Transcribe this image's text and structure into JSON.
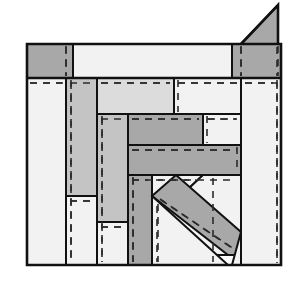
{
  "figure": {
    "kind": "technical-line-diagram",
    "canvas": {
      "width": 300,
      "height": 287,
      "background": "#ffffff"
    },
    "palette": {
      "fill_dark_gray": "#a8a8a8",
      "fill_mid_gray": "#c4c4c4",
      "fill_light_gray": "#dcdcdc",
      "fill_white": "#f2f2f2",
      "stroke": "#111111",
      "dash_stroke": "#2b2b2b"
    },
    "frame": {
      "x": 27,
      "y": 44,
      "width": 254,
      "height": 221
    },
    "blocks": [
      {
        "name": "top-left-header-block",
        "shape": "rect",
        "x": 27,
        "y": 44,
        "w": 46,
        "h": 34,
        "fill": "#a8a8a8",
        "dashes": [
          {
            "x1": 66,
            "y1": 46,
            "x2": 66,
            "y2": 76
          }
        ]
      },
      {
        "name": "top-stretcher-block",
        "shape": "rect",
        "x": 73,
        "y": 44,
        "w": 159,
        "h": 34,
        "fill": "#f2f2f2",
        "dashes": []
      },
      {
        "name": "top-right-header-block",
        "shape": "rect",
        "x": 232,
        "y": 44,
        "w": 49,
        "h": 34,
        "fill": "#a8a8a8",
        "dashes": [
          {
            "x1": 241,
            "y1": 46,
            "x2": 241,
            "y2": 76
          },
          {
            "x1": 278,
            "y1": 46,
            "x2": 278,
            "y2": 76
          }
        ]
      },
      {
        "name": "corner-triangle-block",
        "shape": "triangle",
        "points": "241,44 278,44 278,5",
        "fill": "#a8a8a8",
        "dashes": []
      },
      {
        "name": "left-tall-white-column",
        "shape": "rect",
        "x": 27,
        "y": 78,
        "w": 39,
        "h": 187,
        "fill": "#f2f2f2",
        "dashes": [
          {
            "x1": 30,
            "y1": 83,
            "x2": 62,
            "y2": 83
          }
        ]
      },
      {
        "name": "second-gray-column-upper",
        "shape": "rect",
        "x": 66,
        "y": 78,
        "w": 31,
        "h": 118,
        "fill": "#c4c4c4",
        "dashes": [
          {
            "x1": 70,
            "y1": 83,
            "x2": 93,
            "y2": 83
          },
          {
            "x1": 71,
            "y1": 80,
            "x2": 71,
            "y2": 194
          }
        ]
      },
      {
        "name": "second-white-column-lower",
        "shape": "rect",
        "x": 66,
        "y": 196,
        "w": 31,
        "h": 69,
        "fill": "#f2f2f2",
        "dashes": [
          {
            "x1": 70,
            "y1": 201,
            "x2": 93,
            "y2": 201
          },
          {
            "x1": 71,
            "y1": 198,
            "x2": 71,
            "y2": 263
          }
        ]
      },
      {
        "name": "upper-mid-light-block",
        "shape": "rect",
        "x": 97,
        "y": 78,
        "w": 77,
        "h": 36,
        "fill": "#dcdcdc",
        "dashes": [
          {
            "x1": 101,
            "y1": 83,
            "x2": 170,
            "y2": 83
          }
        ]
      },
      {
        "name": "upper-right-white-block",
        "shape": "rect",
        "x": 174,
        "y": 78,
        "w": 67,
        "h": 36,
        "fill": "#f2f2f2",
        "dashes": [
          {
            "x1": 178,
            "y1": 83,
            "x2": 237,
            "y2": 83
          },
          {
            "x1": 178,
            "y1": 80,
            "x2": 178,
            "y2": 112
          }
        ]
      },
      {
        "name": "right-tall-white-column",
        "shape": "rect",
        "x": 241,
        "y": 78,
        "w": 40,
        "h": 187,
        "fill": "#f2f2f2",
        "dashes": [
          {
            "x1": 245,
            "y1": 83,
            "x2": 277,
            "y2": 83
          },
          {
            "x1": 277,
            "y1": 80,
            "x2": 277,
            "y2": 263
          }
        ]
      },
      {
        "name": "third-gray-column",
        "shape": "rect",
        "x": 97,
        "y": 114,
        "w": 31,
        "h": 108,
        "fill": "#c4c4c4",
        "dashes": [
          {
            "x1": 101,
            "y1": 119,
            "x2": 124,
            "y2": 119
          },
          {
            "x1": 102,
            "y1": 116,
            "x2": 102,
            "y2": 220
          }
        ]
      },
      {
        "name": "third-white-column-lower",
        "shape": "rect",
        "x": 97,
        "y": 222,
        "w": 31,
        "h": 43,
        "fill": "#f2f2f2",
        "dashes": [
          {
            "x1": 101,
            "y1": 227,
            "x2": 124,
            "y2": 227
          },
          {
            "x1": 102,
            "y1": 224,
            "x2": 102,
            "y2": 263
          }
        ]
      },
      {
        "name": "mid-dark-stretcher-block",
        "shape": "rect",
        "x": 128,
        "y": 114,
        "w": 75,
        "h": 31,
        "fill": "#a8a8a8",
        "dashes": [
          {
            "x1": 132,
            "y1": 119,
            "x2": 199,
            "y2": 119
          }
        ]
      },
      {
        "name": "mid-right-white-block",
        "shape": "rect",
        "x": 203,
        "y": 114,
        "w": 38,
        "h": 31,
        "fill": "#f2f2f2",
        "dashes": [
          {
            "x1": 207,
            "y1": 119,
            "x2": 237,
            "y2": 119
          },
          {
            "x1": 207,
            "y1": 116,
            "x2": 207,
            "y2": 143
          }
        ]
      },
      {
        "name": "long-dark-stretcher-block",
        "shape": "rect",
        "x": 128,
        "y": 145,
        "w": 113,
        "h": 30,
        "fill": "#a8a8a8",
        "dashes": [
          {
            "x1": 132,
            "y1": 150,
            "x2": 237,
            "y2": 150
          },
          {
            "x1": 237,
            "y1": 147,
            "x2": 237,
            "y2": 173
          }
        ]
      },
      {
        "name": "lower-gray-column",
        "shape": "rect",
        "x": 128,
        "y": 175,
        "w": 24,
        "h": 90,
        "fill": "#a8a8a8",
        "dashes": [
          {
            "x1": 132,
            "y1": 180,
            "x2": 148,
            "y2": 180
          },
          {
            "x1": 133,
            "y1": 177,
            "x2": 133,
            "y2": 263
          }
        ]
      },
      {
        "name": "lower-left-white-wedge",
        "shape": "polygon",
        "points": "152,175 203,175 152,223",
        "fill": "#f2f2f2",
        "dashes": [
          {
            "x1": 156,
            "y1": 180,
            "x2": 196,
            "y2": 180
          }
        ]
      },
      {
        "name": "diagonal-gray-brace",
        "shape": "polygon",
        "points": "203,175 241,175 241,255 152,255 152,223",
        "fill": "#f2f2f2",
        "dashes": []
      },
      {
        "name": "diagonal-stripe-block",
        "shape": "polygon",
        "points": "152,196 176,175 241,232 241,255 228,255",
        "fill": "#a8a8a8",
        "dashes": [
          {
            "x1": 160,
            "y1": 199,
            "x2": 235,
            "y2": 250
          }
        ]
      },
      {
        "name": "bottom-white-triangle",
        "shape": "polygon",
        "points": "152,196 152,265 228,265",
        "fill": "#f2f2f2",
        "dashes": [
          {
            "x1": 157,
            "y1": 206,
            "x2": 157,
            "y2": 262
          }
        ]
      },
      {
        "name": "bottom-right-white-wedge",
        "shape": "polygon",
        "points": "241,232 241,265 232,265",
        "fill": "#f2f2f2",
        "dashes": []
      }
    ],
    "dash_overlays": [
      {
        "name": "dash-col-left-inner",
        "x1": 71,
        "y1": 82,
        "x2": 71,
        "y2": 262
      },
      {
        "name": "dash-col-third-inner",
        "x1": 102,
        "y1": 118,
        "x2": 102,
        "y2": 262
      },
      {
        "name": "dash-col-lower-inner",
        "x1": 133,
        "y1": 178,
        "x2": 133,
        "y2": 262
      },
      {
        "name": "dash-col-bottom-tri",
        "x1": 158,
        "y1": 204,
        "x2": 158,
        "y2": 262
      },
      {
        "name": "dash-col-right-edge",
        "x1": 213,
        "y1": 178,
        "x2": 213,
        "y2": 262
      },
      {
        "name": "dash-col-far-right",
        "x1": 277,
        "y1": 82,
        "x2": 277,
        "y2": 262
      },
      {
        "name": "dash-row-upper-left",
        "x1": 30,
        "y1": 83,
        "x2": 63,
        "y2": 83
      },
      {
        "name": "dash-row-upper-mid",
        "x1": 101,
        "y1": 83,
        "x2": 170,
        "y2": 83
      },
      {
        "name": "dash-row-upper-right",
        "x1": 178,
        "y1": 83,
        "x2": 237,
        "y2": 83
      },
      {
        "name": "dash-row-far-right",
        "x1": 245,
        "y1": 83,
        "x2": 273,
        "y2": 83
      },
      {
        "name": "dash-row-mid",
        "x1": 132,
        "y1": 119,
        "x2": 199,
        "y2": 119
      },
      {
        "name": "dash-row-mid-right",
        "x1": 208,
        "y1": 119,
        "x2": 236,
        "y2": 119
      },
      {
        "name": "dash-row-long",
        "x1": 132,
        "y1": 150,
        "x2": 236,
        "y2": 150
      },
      {
        "name": "dash-row-lower",
        "x1": 132,
        "y1": 180,
        "x2": 236,
        "y2": 180
      },
      {
        "name": "dash-row-second-col",
        "x1": 70,
        "y1": 201,
        "x2": 93,
        "y2": 201
      },
      {
        "name": "dash-row-third-col",
        "x1": 101,
        "y1": 227,
        "x2": 124,
        "y2": 227
      },
      {
        "name": "dash-diagonal-stripe",
        "x1": 161,
        "y1": 200,
        "x2": 234,
        "y2": 249
      },
      {
        "name": "dash-col-top-left-header",
        "x1": 66,
        "y1": 47,
        "x2": 66,
        "y2": 76
      },
      {
        "name": "dash-col-top-right-header-a",
        "x1": 241,
        "y1": 47,
        "x2": 241,
        "y2": 76
      },
      {
        "name": "dash-col-top-right-header-b",
        "x1": 277,
        "y1": 47,
        "x2": 277,
        "y2": 76
      }
    ],
    "edges": [
      {
        "name": "frame-outline",
        "d": "M27,44 L281,44 L281,265 L27,265 Z"
      },
      {
        "name": "top-band-bottom-rule",
        "d": "M27,78 L281,78"
      },
      {
        "name": "triangle-hypotenuse",
        "d": "M241,44 L278,5 L278,44"
      }
    ]
  }
}
